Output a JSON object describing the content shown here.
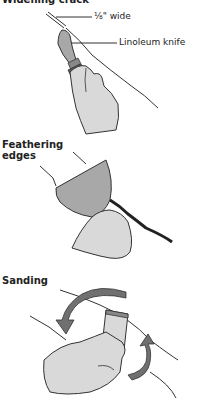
{
  "panels": [
    {
      "heading": "Widening crack",
      "callouts": [
        {
          "text": "⅛\" wide"
        },
        {
          "text": "Linoleum knife"
        }
      ]
    },
    {
      "heading_line1": "Feathering",
      "heading_line2": "edges"
    },
    {
      "heading": "Sanding"
    }
  ],
  "colors": {
    "ink": "#222222",
    "skin": "#d9d9d9",
    "tool_fill": "#a8a8a8",
    "dark_fill": "#555555",
    "arrow": "#707070"
  }
}
